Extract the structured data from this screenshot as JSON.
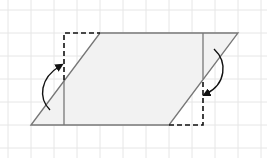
{
  "diagram": {
    "colors": {
      "background": "#ffffff",
      "grid": "#e6e6e6",
      "outline": "#777777",
      "fill": "#f2f2f2",
      "dashed": "#111111",
      "arrow": "#111111"
    },
    "grid": {
      "spacing": 23,
      "x_start": 8,
      "y_start": 10
    },
    "parallelogram": {
      "points": [
        [
          31,
          125
        ],
        [
          100,
          33
        ],
        [
          238,
          33
        ],
        [
          169,
          125
        ]
      ]
    },
    "height_lines": [
      {
        "x": 64,
        "y1": 80,
        "y2": 125
      },
      {
        "x": 203,
        "y1": 33,
        "y2": 79
      }
    ],
    "dashed_triangles": [
      {
        "name": "moved-left",
        "points": [
          [
            64,
            80
          ],
          [
            64,
            33
          ],
          [
            100,
            33
          ]
        ]
      },
      {
        "name": "moved-right",
        "points": [
          [
            169,
            125
          ],
          [
            203,
            125
          ],
          [
            203,
            79
          ]
        ]
      }
    ],
    "arrows": [
      {
        "name": "rotate-left-arrow",
        "path": "M50,110 C38,98 40,78 60,66"
      },
      {
        "name": "rotate-right-arrow",
        "path": "M214,49 C228,62 226,84 206,94"
      }
    ]
  }
}
